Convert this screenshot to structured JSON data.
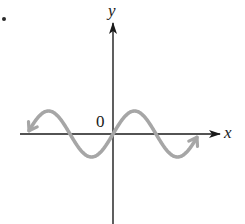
{
  "figure": {
    "bullet": "•",
    "origin_label": "0",
    "x_axis_label": "x",
    "y_axis_label": "y",
    "colors": {
      "axis": "#1a1a1a",
      "curve": "#a6a6a6",
      "background": "#ffffff"
    }
  },
  "chart_data": {
    "type": "line",
    "title": "",
    "xlabel": "x",
    "ylabel": "y",
    "function": "y = sin(x)",
    "origin_label": "0",
    "x_range": [
      -6.28,
      6.28
    ],
    "y_range": [
      -1,
      1
    ],
    "grid": false,
    "legend": null,
    "series": [
      {
        "name": "sin(x)",
        "x": [
          -5.5,
          -4.712,
          -3.1416,
          -1.5708,
          0,
          1.5708,
          3.1416,
          4.712,
          5.5
        ],
        "values": [
          0.71,
          1,
          0,
          -1,
          0,
          1,
          0,
          -1,
          -0.71
        ]
      }
    ],
    "annotations": [
      "arrowheads at both ends of curve",
      "arrowheads on positive x-axis and positive y-axis"
    ]
  }
}
